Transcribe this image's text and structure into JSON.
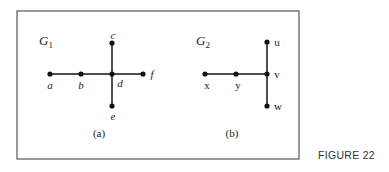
{
  "figure_label": "FIGURE 22",
  "frame": {
    "x": 17,
    "y": 11,
    "width": 282,
    "height": 148
  },
  "graphs": [
    {
      "name": "G",
      "subscript": "1",
      "caption": "(a)",
      "title_pos": {
        "x": 39,
        "y": 45
      },
      "caption_pos": {
        "x": 99,
        "y": 137
      },
      "nodes": [
        {
          "id": "a",
          "label": "a",
          "x": 50,
          "y": 74,
          "lx": 50,
          "ly": 89,
          "italic": true
        },
        {
          "id": "b",
          "label": "b",
          "x": 81,
          "y": 74,
          "lx": 81,
          "ly": 89,
          "italic": true
        },
        {
          "id": "d",
          "label": "d",
          "x": 112,
          "y": 74,
          "lx": 120,
          "ly": 87,
          "italic": true
        },
        {
          "id": "f",
          "label": "f",
          "x": 143,
          "y": 74,
          "lx": 152,
          "ly": 78,
          "italic": true
        },
        {
          "id": "c",
          "label": "c",
          "x": 112,
          "y": 43,
          "lx": 113,
          "ly": 39,
          "italic": true
        },
        {
          "id": "e",
          "label": "e",
          "x": 112,
          "y": 106,
          "lx": 113,
          "ly": 120,
          "italic": true
        }
      ],
      "edges": [
        [
          "a",
          "b"
        ],
        [
          "b",
          "d"
        ],
        [
          "d",
          "f"
        ],
        [
          "c",
          "d"
        ],
        [
          "d",
          "e"
        ]
      ]
    },
    {
      "name": "G",
      "subscript": "2",
      "caption": "(b)",
      "title_pos": {
        "x": 196,
        "y": 45
      },
      "caption_pos": {
        "x": 232,
        "y": 137
      },
      "nodes": [
        {
          "id": "x",
          "label": "x",
          "x": 205,
          "y": 74,
          "lx": 207,
          "ly": 89,
          "italic": false
        },
        {
          "id": "y",
          "label": "y",
          "x": 236,
          "y": 74,
          "lx": 238,
          "ly": 89,
          "italic": false
        },
        {
          "id": "v",
          "label": "v",
          "x": 267,
          "y": 74,
          "lx": 277,
          "ly": 78,
          "italic": false
        },
        {
          "id": "u",
          "label": "u",
          "x": 267,
          "y": 42,
          "lx": 277,
          "ly": 46,
          "italic": false
        },
        {
          "id": "w",
          "label": "w",
          "x": 267,
          "y": 106,
          "lx": 278,
          "ly": 110,
          "italic": false
        }
      ],
      "edges": [
        [
          "x",
          "y"
        ],
        [
          "y",
          "v"
        ],
        [
          "u",
          "v"
        ],
        [
          "v",
          "w"
        ]
      ]
    }
  ]
}
